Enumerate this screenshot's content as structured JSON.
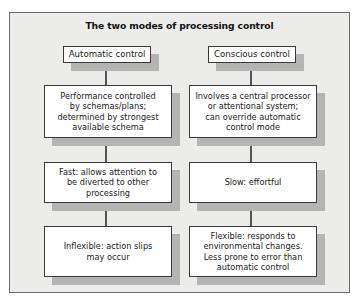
{
  "title": "The two modes of processing control",
  "colors": {
    "frame_background": "#ececea",
    "frame_border": "#6e6e6e",
    "box_background": "#ffffff",
    "box_border": "#3a3a3a",
    "shadow": "#b4b4b4",
    "connector": "#555555"
  },
  "columns": [
    {
      "header": "Automatic control",
      "boxes": [
        "Performance controlled\nby schemas/plans;\ndetermined by strongest\navailable schema",
        "Fast: allows attention to\nbe diverted to other\nprocessing",
        "Inflexible: action slips\nmay occur"
      ]
    },
    {
      "header": "Conscious control",
      "boxes": [
        "Involves a central processor\nor attentional system;\ncan override automatic\ncontrol mode",
        "Slow: effortful",
        "Flexible: responds to\nenvironmental changes.\nLess prone to error than\nautomatic control"
      ]
    }
  ]
}
